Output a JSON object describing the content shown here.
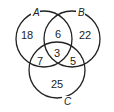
{
  "diagram": {
    "type": "venn",
    "sets": [
      {
        "id": "A",
        "label": "A"
      },
      {
        "id": "B",
        "label": "B"
      },
      {
        "id": "C",
        "label": "C"
      }
    ],
    "regions": {
      "A_only": "18",
      "B_only": "22",
      "C_only": "25",
      "AB_only": "6",
      "AC_only": "7",
      "BC_only": "5",
      "ABC": "3"
    }
  }
}
